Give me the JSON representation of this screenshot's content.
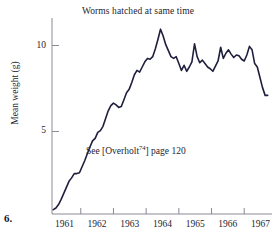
{
  "figure": {
    "number_label": "6.",
    "annotation_prefix": "See [Overholt",
    "annotation_superscript": "74",
    "annotation_suffix": "] page 120"
  },
  "chart_data": {
    "type": "line",
    "title": "Worms hatched at same time",
    "xlabel": "",
    "ylabel": "Mean weight (g)",
    "xlim": [
      1960.62,
      1967.35
    ],
    "ylim": [
      0.2,
      11.6
    ],
    "grid": false,
    "legend": "none",
    "line_color": "#1f1f3d",
    "axis_color": "#8a8a95",
    "y_ticks": [
      5,
      10
    ],
    "y_tick_labels": [
      "5",
      "10"
    ],
    "x_ticks": [
      1961,
      1962,
      1963,
      1964,
      1965,
      1966,
      1967
    ],
    "x_tick_labels": [
      "1961",
      "1962",
      "1963",
      "1964",
      "1965",
      "1966",
      "1967"
    ],
    "x_tick_mark_positions": [
      1961.5,
      1962.5,
      1963.5,
      1964.5,
      1965.5,
      1966.5
    ],
    "series": [
      {
        "name": "Mean weight",
        "x": [
          1960.66,
          1960.74,
          1960.82,
          1960.9,
          1960.98,
          1961.06,
          1961.14,
          1961.22,
          1961.3,
          1961.38,
          1961.46,
          1961.54,
          1961.62,
          1961.7,
          1961.78,
          1961.86,
          1961.94,
          1962.02,
          1962.1,
          1962.18,
          1962.26,
          1962.34,
          1962.42,
          1962.5,
          1962.58,
          1962.66,
          1962.74,
          1962.82,
          1962.9,
          1962.98,
          1963.06,
          1963.14,
          1963.22,
          1963.3,
          1963.38,
          1963.46,
          1963.54,
          1963.62,
          1963.7,
          1963.78,
          1963.86,
          1963.94,
          1964.02,
          1964.1,
          1964.18,
          1964.26,
          1964.34,
          1964.42,
          1964.5,
          1964.58,
          1964.66,
          1964.74,
          1964.82,
          1964.9,
          1964.98,
          1965.06,
          1965.14,
          1965.22,
          1965.3,
          1965.38,
          1965.46,
          1965.54,
          1965.62,
          1965.7,
          1965.78,
          1965.86,
          1965.94,
          1966.02,
          1966.1,
          1966.18,
          1966.26,
          1966.34,
          1966.42,
          1966.5,
          1966.58,
          1966.66,
          1966.74,
          1966.82,
          1966.9,
          1966.98,
          1967.06,
          1967.14,
          1967.22
        ],
        "y": [
          0.45,
          0.55,
          0.75,
          1.05,
          1.4,
          1.75,
          2.1,
          2.3,
          2.55,
          2.55,
          2.6,
          2.95,
          3.3,
          3.7,
          4.1,
          4.45,
          4.6,
          4.95,
          5.05,
          5.3,
          5.75,
          6.2,
          6.5,
          6.65,
          6.55,
          6.4,
          6.45,
          6.85,
          7.25,
          7.45,
          7.85,
          8.3,
          8.55,
          8.45,
          8.75,
          9.05,
          9.25,
          9.2,
          9.35,
          9.8,
          10.35,
          10.95,
          10.55,
          10.05,
          9.7,
          9.35,
          9.25,
          9.35,
          8.95,
          8.55,
          8.85,
          8.5,
          8.75,
          9.05,
          10.1,
          9.35,
          9.0,
          9.15,
          8.95,
          8.75,
          8.65,
          8.5,
          8.8,
          9.1,
          9.9,
          9.25,
          9.55,
          9.75,
          9.5,
          9.3,
          9.45,
          9.4,
          9.2,
          9.1,
          9.45,
          9.95,
          9.75,
          8.95,
          8.75,
          8.15,
          7.55,
          7.1,
          7.1
        ]
      }
    ]
  }
}
